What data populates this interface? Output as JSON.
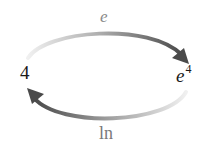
{
  "diagram": {
    "top_function": "e",
    "bottom_function": "ln",
    "left_value": "4",
    "right_value_base": "e",
    "right_value_exponent": "4",
    "arrows": [
      {
        "from": "4",
        "to": "e^4",
        "label": "e",
        "direction": "clockwise-top"
      },
      {
        "from": "e^4",
        "to": "4",
        "label": "ln",
        "direction": "clockwise-bottom"
      }
    ],
    "colors": {
      "arrow_dark": "#555555",
      "arrow_light": "#e6e6e6",
      "text": "#1a1a1a",
      "label": "#8a8a8a"
    }
  }
}
